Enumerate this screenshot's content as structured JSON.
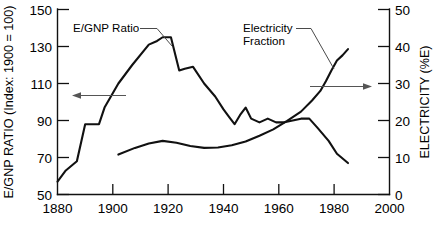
{
  "chart_data": {
    "type": "line",
    "title": "",
    "xlabel": "",
    "xlim": [
      1880,
      2000
    ],
    "xticks": [
      1880,
      1900,
      1920,
      1940,
      1960,
      1980,
      2000
    ],
    "xticklabels": [
      "1880",
      "1900",
      "1920",
      "1940",
      "1960",
      "1980",
      "2000"
    ],
    "grid": false,
    "legend": "none",
    "annotations": [
      {
        "text": "E/GNP Ratio",
        "points_to": "left-axis-series"
      },
      {
        "text": "Electricity",
        "points_to": "right-axis-series"
      },
      {
        "text": "Fraction",
        "points_to": "right-axis-series"
      }
    ],
    "axes": [
      {
        "position": "left",
        "label": "E/GNP RATIO (Index: 1900 = 100)",
        "ylim": [
          50,
          150
        ],
        "yticks": [
          50,
          70,
          90,
          110,
          130,
          150
        ],
        "yticklabels": [
          "50",
          "70",
          "90",
          "110",
          "130",
          "150"
        ]
      },
      {
        "position": "right",
        "label": "ELECTRICITY (%E)",
        "ylim": [
          0,
          50
        ],
        "yticks": [
          0,
          10,
          20,
          30,
          40,
          50
        ],
        "yticklabels": [
          "0",
          "10",
          "20",
          "30",
          "40",
          "50"
        ]
      }
    ],
    "series": [
      {
        "name": "E/GNP Ratio",
        "axis": "left",
        "units": "Index: 1900 = 100",
        "x": [
          1880,
          1883,
          1887,
          1890,
          1895,
          1897,
          1902,
          1907,
          1913,
          1916,
          1918,
          1921,
          1924,
          1926,
          1929,
          1933,
          1937,
          1940,
          1942,
          1944,
          1946,
          1948,
          1950,
          1953,
          1956,
          1959,
          1962,
          1965,
          1968,
          1971,
          1974,
          1978,
          1981,
          1985
        ],
        "values": [
          57,
          63,
          68,
          88,
          88,
          97,
          110,
          120,
          131,
          133,
          135,
          135,
          117,
          118,
          119,
          110,
          103,
          96,
          92,
          88,
          93,
          97,
          91,
          89,
          91,
          89,
          89,
          90,
          91,
          91,
          86,
          79,
          72,
          67
        ]
      },
      {
        "name": "Electricity Fraction",
        "axis": "right",
        "units": "%E",
        "x": [
          1902,
          1908,
          1913,
          1918,
          1923,
          1928,
          1933,
          1938,
          1943,
          1948,
          1953,
          1958,
          1963,
          1968,
          1972,
          1975,
          1977,
          1979,
          1981,
          1983,
          1985
        ],
        "values": [
          10.8,
          12.6,
          13.8,
          14.5,
          14.0,
          13.1,
          12.6,
          12.7,
          13.3,
          14.3,
          15.9,
          17.6,
          19.9,
          22.4,
          25.4,
          28.0,
          30.6,
          33.5,
          36.2,
          37.6,
          39.3
        ]
      }
    ]
  },
  "left_axis": {
    "title": "E/GNP RATIO (Index: 1900 = 100)",
    "ticks": [
      "150",
      "130",
      "110",
      "90",
      "70",
      "50"
    ]
  },
  "right_axis": {
    "title": "ELECTRICITY (%E)",
    "ticks": [
      "50",
      "40",
      "30",
      "20",
      "10",
      "0"
    ]
  },
  "x_axis": {
    "ticks": [
      "1880",
      "1900",
      "1920",
      "1940",
      "1960",
      "1980",
      "2000"
    ]
  },
  "annotations": {
    "egnp_label": "E/GNP Ratio",
    "electricity_label_line1": "Electricity",
    "electricity_label_line2": "Fraction"
  }
}
